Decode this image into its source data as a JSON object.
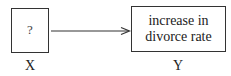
{
  "diagram": {
    "nodes": [
      {
        "id": "X",
        "box_text": "?",
        "label": "X"
      },
      {
        "id": "Y",
        "box_text_lines": [
          "increase in",
          "divorce rate"
        ],
        "label": "Y"
      }
    ],
    "edges": [
      {
        "from": "X",
        "to": "Y",
        "style": "arrow"
      }
    ],
    "colors": {
      "stroke": "#333333",
      "background": "#ffffff"
    }
  }
}
